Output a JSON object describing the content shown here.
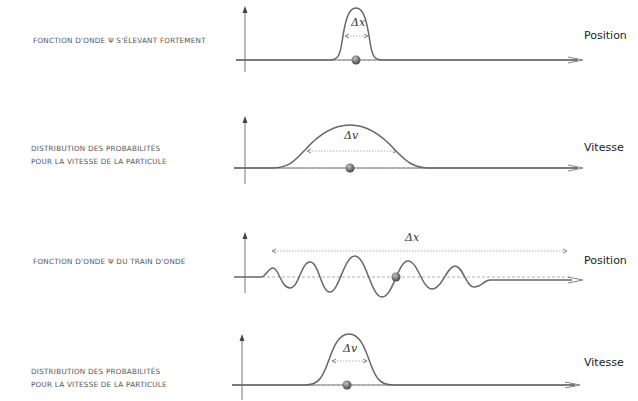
{
  "panels": [
    {
      "caption_lines": [
        "Fonction d'onde Ψ s'élevant fortement"
      ],
      "axis_label": "Position",
      "delta_label": "Δx",
      "curve": "narrow-peak"
    },
    {
      "caption_lines": [
        "Distribution des probabilités",
        "pour la vitesse de la particule"
      ],
      "axis_label": "Vitesse",
      "delta_label": "Δv",
      "curve": "wide-bell"
    },
    {
      "caption_lines": [
        "Fonction d'onde Ψ du train d'onde"
      ],
      "axis_label": "Position",
      "delta_label": "Δx",
      "curve": "wave-train"
    },
    {
      "caption_lines": [
        "Distribution des probabilités",
        "pour la vitesse de la particule"
      ],
      "axis_label": "Vitesse",
      "delta_label": "Δv",
      "curve": "narrow-bell"
    }
  ],
  "colors": {
    "curve": "#666666",
    "axis": "#777777",
    "dashed": "#999999",
    "particle": "#7a7a7a"
  }
}
